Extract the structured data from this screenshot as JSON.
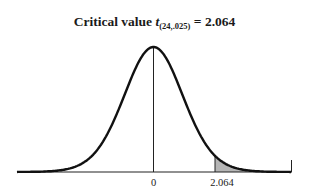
{
  "chart_data": {
    "type": "area",
    "title": "Critical value t(24,.025) = 2.064",
    "title_parts": {
      "prefix": "Critical value ",
      "var": "t",
      "subscript": "(24,.025)",
      "equals": " = ",
      "value": "2.064"
    },
    "distribution": "Student t",
    "df": 24,
    "alpha": 0.025,
    "critical_value": 2.064,
    "xlabel": "",
    "ylabel": "",
    "x_ticks": [
      {
        "label": "0",
        "value": 0
      },
      {
        "label": "2.064",
        "value": 2.064
      }
    ],
    "shaded_region": {
      "from": 2.064,
      "to": "upper tail",
      "color": "#b5b5b5"
    },
    "grid": false,
    "legend": null
  },
  "colors": {
    "curve": "#111111",
    "shade": "#b5b5b5",
    "axis": "#222222"
  }
}
